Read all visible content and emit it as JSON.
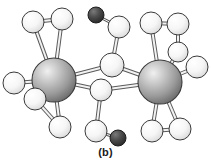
{
  "figure": {
    "caption": "(b)",
    "type": "ball-and-stick molecular structure diagram",
    "background_color": "#ffffff"
  },
  "palette": {
    "metal_fill_light": "#e8e8e8",
    "metal_fill_mid": "#a8a8a8",
    "metal_fill_dark": "#6e6e6e",
    "light_atom_fill_light": "#ffffff",
    "light_atom_fill_mid": "#ececec",
    "light_atom_fill_dark": "#c6c6c6",
    "dark_atom_fill_light": "#6a6a6a",
    "dark_atom_fill_mid": "#4a4a4a",
    "dark_atom_fill_dark": "#2b2b2b",
    "outline_color": "#3a3a3a",
    "bond_fill": "#f2f2f2",
    "bond_stroke": "#5a5a5a"
  },
  "atoms": [
    {
      "id": "M1",
      "label": "metal-atom-left",
      "kind": "metal",
      "x": 54,
      "y": 80,
      "r": 22
    },
    {
      "id": "M2",
      "label": "metal-atom-right",
      "kind": "metal",
      "x": 160,
      "y": 82,
      "r": 22
    },
    {
      "id": "L1",
      "label": "light-atom-top-left-outer",
      "kind": "light",
      "x": 33,
      "y": 22,
      "r": 11
    },
    {
      "id": "L2",
      "label": "light-atom-top-left-inner",
      "kind": "light",
      "x": 62,
      "y": 19,
      "r": 11
    },
    {
      "id": "L3",
      "label": "light-atom-left-outer",
      "kind": "light",
      "x": 14,
      "y": 83,
      "r": 11
    },
    {
      "id": "L4",
      "label": "light-atom-left-lower-inner",
      "kind": "light",
      "x": 35,
      "y": 99,
      "r": 11
    },
    {
      "id": "L5",
      "label": "light-atom-bottom-left",
      "kind": "light",
      "x": 60,
      "y": 127,
      "r": 11
    },
    {
      "id": "B1",
      "label": "bridging-atom-upper",
      "kind": "light",
      "x": 112,
      "y": 65,
      "r": 12
    },
    {
      "id": "B2",
      "label": "bridging-atom-lower",
      "kind": "light",
      "x": 101,
      "y": 90,
      "r": 11
    },
    {
      "id": "L6",
      "label": "light-atom-upper-bridge-chain",
      "kind": "light",
      "x": 119,
      "y": 27,
      "r": 11
    },
    {
      "id": "L7",
      "label": "light-atom-lower-bridge-chain",
      "kind": "light",
      "x": 96,
      "y": 131,
      "r": 11
    },
    {
      "id": "D1",
      "label": "dark-atom-top",
      "kind": "dark",
      "x": 96,
      "y": 15,
      "r": 8
    },
    {
      "id": "D2",
      "label": "dark-atom-bottom",
      "kind": "dark",
      "x": 118,
      "y": 138,
      "r": 8
    },
    {
      "id": "R1",
      "label": "light-atom-top-right-inner",
      "kind": "light",
      "x": 151,
      "y": 23,
      "r": 11
    },
    {
      "id": "R2",
      "label": "light-atom-top-right-outer",
      "kind": "light",
      "x": 178,
      "y": 24,
      "r": 11
    },
    {
      "id": "R3",
      "label": "light-atom-right-mid",
      "kind": "light",
      "x": 178,
      "y": 52,
      "r": 10
    },
    {
      "id": "R4",
      "label": "light-atom-right-outer",
      "kind": "light",
      "x": 197,
      "y": 67,
      "r": 11
    },
    {
      "id": "R5",
      "label": "light-atom-bottom-right-inner",
      "kind": "light",
      "x": 152,
      "y": 131,
      "r": 11
    },
    {
      "id": "R6",
      "label": "light-atom-bottom-right-outer",
      "kind": "light",
      "x": 180,
      "y": 129,
      "r": 11
    }
  ],
  "bonds": [
    {
      "from": "L1",
      "to": "L2",
      "width": 4
    },
    {
      "from": "L1",
      "to": "M1",
      "width": 4
    },
    {
      "from": "L2",
      "to": "M1",
      "width": 4
    },
    {
      "from": "L3",
      "to": "M1",
      "width": 4
    },
    {
      "from": "L4",
      "to": "M1",
      "width": 4
    },
    {
      "from": "L5",
      "to": "M1",
      "width": 4
    },
    {
      "from": "L4",
      "to": "L5",
      "width": 4
    },
    {
      "from": "M1",
      "to": "B1",
      "width": 4
    },
    {
      "from": "M1",
      "to": "B2",
      "width": 4
    },
    {
      "from": "M2",
      "to": "B1",
      "width": 4
    },
    {
      "from": "M2",
      "to": "B2",
      "width": 4
    },
    {
      "from": "B1",
      "to": "L6",
      "width": 4
    },
    {
      "from": "L6",
      "to": "D1",
      "width": 3
    },
    {
      "from": "B2",
      "to": "L7",
      "width": 4
    },
    {
      "from": "L7",
      "to": "D2",
      "width": 3
    },
    {
      "from": "R1",
      "to": "R2",
      "width": 4
    },
    {
      "from": "R1",
      "to": "M2",
      "width": 4
    },
    {
      "from": "R2",
      "to": "R3",
      "width": 4
    },
    {
      "from": "R3",
      "to": "M2",
      "width": 4
    },
    {
      "from": "R4",
      "to": "M2",
      "width": 4
    },
    {
      "from": "R5",
      "to": "M2",
      "width": 4
    },
    {
      "from": "R6",
      "to": "M2",
      "width": 4
    },
    {
      "from": "R5",
      "to": "R6",
      "width": 4
    }
  ],
  "draw_order": [
    "L1",
    "L2",
    "L6",
    "D1",
    "R1",
    "R2",
    "R3",
    "M1",
    "M2",
    "B1",
    "B2",
    "L3",
    "L4",
    "L5",
    "R4",
    "L7",
    "D2",
    "R5",
    "R6"
  ]
}
